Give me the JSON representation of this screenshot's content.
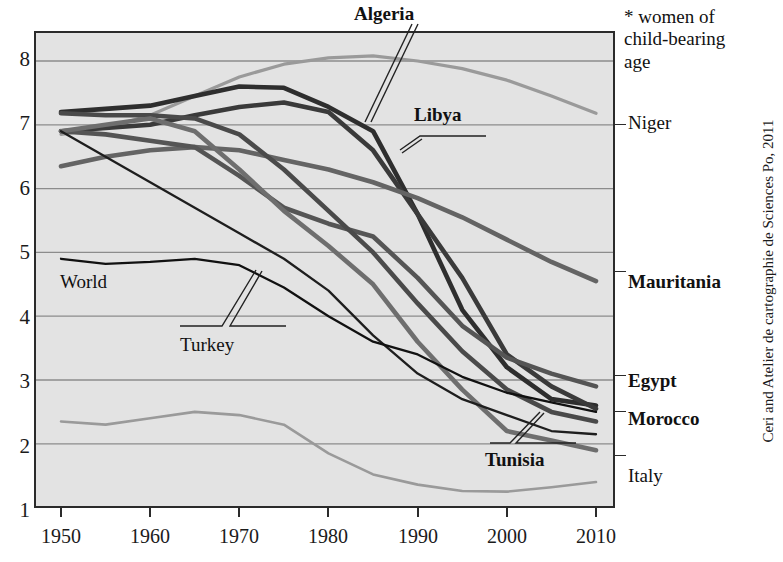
{
  "chart_data": {
    "type": "line",
    "title": "",
    "xlabel": "",
    "ylabel": "",
    "note": "* women of child-bearing age",
    "credit": "Ceri and Atelier de cartographie de Sciences Po, 2011",
    "xlim": [
      1950,
      2010
    ],
    "ylim": [
      1,
      8.6
    ],
    "grid": true,
    "grid_axis": "y",
    "x_ticks": [
      1950,
      1960,
      1970,
      1980,
      1990,
      2000,
      2010
    ],
    "y_ticks": [
      1,
      2,
      3,
      4,
      5,
      6,
      7,
      8
    ],
    "legend_position": "right-of-axis-and-inline-callouts",
    "x": [
      1950,
      1955,
      1960,
      1965,
      1970,
      1975,
      1980,
      1985,
      1990,
      1995,
      2000,
      2005,
      2010
    ],
    "series": [
      {
        "name": "Niger",
        "label_side": "right",
        "color": "#9a9a9a",
        "width": 3.2,
        "values": [
          6.85,
          6.95,
          7.15,
          7.45,
          7.75,
          7.95,
          8.05,
          8.08,
          8.0,
          7.88,
          7.7,
          7.45,
          7.18
        ]
      },
      {
        "name": "Algeria",
        "label_side": "callout",
        "color": "#2e2e2e",
        "width": 4.6,
        "values": [
          7.2,
          7.25,
          7.3,
          7.45,
          7.6,
          7.58,
          7.28,
          6.9,
          5.6,
          4.1,
          3.2,
          2.7,
          2.6
        ]
      },
      {
        "name": "Libya",
        "label_side": "callout",
        "color": "#3a3a3a",
        "width": 4.6,
        "values": [
          6.9,
          6.95,
          7.0,
          7.15,
          7.28,
          7.35,
          7.2,
          6.6,
          5.6,
          4.6,
          3.4,
          2.9,
          2.55
        ]
      },
      {
        "name": "Mauritania",
        "label_side": "right",
        "color": "#646464",
        "width": 4.6,
        "values": [
          6.35,
          6.5,
          6.6,
          6.65,
          6.6,
          6.45,
          6.3,
          6.1,
          5.85,
          5.55,
          5.2,
          4.85,
          4.55
        ]
      },
      {
        "name": "Egypt",
        "label_side": "right",
        "color": "#555555",
        "width": 4.6,
        "values": [
          6.9,
          6.85,
          6.75,
          6.65,
          6.2,
          5.7,
          5.45,
          5.25,
          4.6,
          3.85,
          3.35,
          3.1,
          2.9
        ]
      },
      {
        "name": "Morocco",
        "label_side": "right",
        "color": "#4a4a4a",
        "width": 4.6,
        "values": [
          7.18,
          7.15,
          7.15,
          7.1,
          6.85,
          6.3,
          5.65,
          5.0,
          4.2,
          3.45,
          2.85,
          2.5,
          2.35
        ]
      },
      {
        "name": "Tunisia",
        "label_side": "callout",
        "color": "#6e6e6e",
        "width": 4.6,
        "values": [
          6.9,
          7.0,
          7.1,
          6.9,
          6.3,
          5.65,
          5.1,
          4.5,
          3.6,
          2.85,
          2.2,
          2.05,
          1.9
        ]
      },
      {
        "name": "Turkey",
        "label_side": "callout",
        "color": "#1e1e1e",
        "width": 2.3,
        "values": [
          6.9,
          6.5,
          6.1,
          5.7,
          5.3,
          4.9,
          4.4,
          3.7,
          3.1,
          2.7,
          2.45,
          2.2,
          2.15
        ]
      },
      {
        "name": "World",
        "label_side": "callout",
        "color": "#111111",
        "width": 2.3,
        "values": [
          4.9,
          4.82,
          4.85,
          4.9,
          4.8,
          4.45,
          4.0,
          3.6,
          3.4,
          3.05,
          2.8,
          2.65,
          2.5
        ]
      },
      {
        "name": "Italy",
        "label_side": "right",
        "color": "#9a9a9a",
        "width": 2.6,
        "values": [
          2.35,
          2.3,
          2.4,
          2.5,
          2.45,
          2.3,
          1.85,
          1.52,
          1.36,
          1.26,
          1.25,
          1.32,
          1.4
        ]
      }
    ]
  },
  "axis": {
    "y_ticks": [
      "8",
      "7",
      "6",
      "5",
      "4",
      "3",
      "2",
      "1"
    ],
    "x_ticks": [
      "1950",
      "1960",
      "1970",
      "1980",
      "1990",
      "2000",
      "2010"
    ]
  },
  "right_labels": [
    {
      "text": "Niger",
      "bold": false
    },
    {
      "text": "Mauritania",
      "bold": true
    },
    {
      "text": "Egypt",
      "bold": true
    },
    {
      "text": "Morocco",
      "bold": true
    },
    {
      "text": "Italy",
      "bold": false
    }
  ],
  "callouts": [
    {
      "text": "Algeria",
      "bold": true
    },
    {
      "text": "Libya",
      "bold": true
    },
    {
      "text": "Tunisia",
      "bold": true
    },
    {
      "text": "Turkey",
      "bold": false
    },
    {
      "text": "World",
      "bold": false
    }
  ],
  "footnote": {
    "line1": "* women of",
    "line2": "child-bearing",
    "line3": "age"
  },
  "credit": "Ceri and Atelier de cartographie de Sciences Po, 2011",
  "colors": {
    "plot_background": "#e3e3e3",
    "frame": "#2b2b2b",
    "gridline": "#8c8c8c",
    "page_background": "#ffffff"
  }
}
